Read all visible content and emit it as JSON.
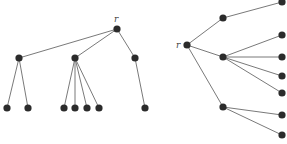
{
  "diagram": {
    "colors": {
      "node": "#2b2b2b",
      "edge": "#6a6a6a",
      "label": "#444444"
    },
    "node_radius": 3.6,
    "trees": [
      {
        "name": "top-down-tree",
        "root_label": "r",
        "label_pos": {
          "x": 114,
          "y": 22
        },
        "nodes": [
          {
            "id": "r",
            "x": 117,
            "y": 29
          },
          {
            "id": "a",
            "x": 19,
            "y": 58
          },
          {
            "id": "b",
            "x": 75,
            "y": 58
          },
          {
            "id": "c",
            "x": 135,
            "y": 58
          },
          {
            "id": "a1",
            "x": 7,
            "y": 108
          },
          {
            "id": "a2",
            "x": 28,
            "y": 108
          },
          {
            "id": "b1",
            "x": 64,
            "y": 108
          },
          {
            "id": "b2",
            "x": 75,
            "y": 108
          },
          {
            "id": "b3",
            "x": 87,
            "y": 108
          },
          {
            "id": "b4",
            "x": 99,
            "y": 108
          },
          {
            "id": "c1",
            "x": 145,
            "y": 108
          }
        ],
        "edges": [
          [
            "r",
            "a"
          ],
          [
            "r",
            "b"
          ],
          [
            "r",
            "c"
          ],
          [
            "a",
            "a1"
          ],
          [
            "a",
            "a2"
          ],
          [
            "b",
            "b1"
          ],
          [
            "b",
            "b2"
          ],
          [
            "b",
            "b3"
          ],
          [
            "b",
            "b4"
          ],
          [
            "c",
            "c1"
          ]
        ]
      },
      {
        "name": "left-right-tree",
        "root_label": "r",
        "label_pos": {
          "x": 176,
          "y": 48
        },
        "nodes": [
          {
            "id": "r",
            "x": 187,
            "y": 45
          },
          {
            "id": "a",
            "x": 223,
            "y": 18
          },
          {
            "id": "b",
            "x": 223,
            "y": 57
          },
          {
            "id": "c",
            "x": 223,
            "y": 107
          },
          {
            "id": "a1",
            "x": 282,
            "y": 2
          },
          {
            "id": "b1",
            "x": 282,
            "y": 35
          },
          {
            "id": "b2",
            "x": 282,
            "y": 57
          },
          {
            "id": "b3",
            "x": 282,
            "y": 76
          },
          {
            "id": "b4",
            "x": 282,
            "y": 93
          },
          {
            "id": "c1",
            "x": 282,
            "y": 115
          },
          {
            "id": "c2",
            "x": 282,
            "y": 135
          }
        ],
        "edges": [
          [
            "r",
            "a"
          ],
          [
            "r",
            "b"
          ],
          [
            "r",
            "c"
          ],
          [
            "a",
            "a1"
          ],
          [
            "b",
            "b1"
          ],
          [
            "b",
            "b2"
          ],
          [
            "b",
            "b3"
          ],
          [
            "b",
            "b4"
          ],
          [
            "c",
            "c1"
          ],
          [
            "c",
            "c2"
          ]
        ]
      }
    ]
  }
}
